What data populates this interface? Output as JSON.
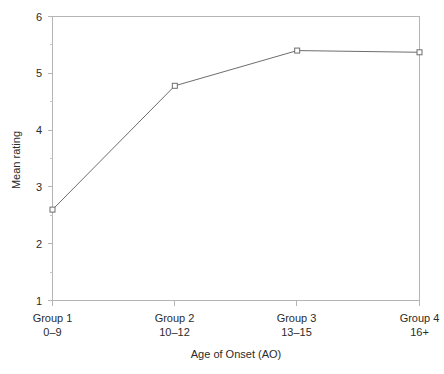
{
  "chart_data": {
    "type": "line",
    "title": "",
    "subtitle": "",
    "xlabel": "Age of Onset (AO)",
    "ylabel": "Mean rating",
    "categories": [
      "Group 1",
      "Group 2",
      "Group 3",
      "Group 4"
    ],
    "category_sublabels": [
      "0–9",
      "10–12",
      "13–15",
      "16+"
    ],
    "values": [
      2.6,
      4.78,
      5.4,
      5.37
    ],
    "series": [
      {
        "name": "Mean rating",
        "values": [
          2.6,
          4.78,
          5.4,
          5.37
        ]
      }
    ],
    "ylim": [
      1,
      6
    ],
    "xlim": [
      0,
      3
    ],
    "ytick_labels": [
      "1",
      "2",
      "3",
      "4",
      "5",
      "6"
    ],
    "ytick_values": [
      1,
      2,
      3,
      4,
      5,
      6
    ],
    "yminor_tick_values": [
      1.5,
      2.5,
      3.5,
      4.5,
      5.5
    ],
    "grid": "off",
    "legend": "none",
    "marker": "open-square",
    "line_color": "#6d6d6d",
    "axis_color": "#b4b4b4",
    "marker_fill": "#ffffff",
    "background_color": "#ffffff"
  },
  "axis": {
    "y_title": "Mean rating",
    "x_title": "Age of Onset (AO)"
  }
}
